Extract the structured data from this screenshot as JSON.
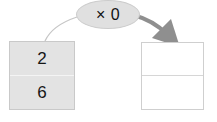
{
  "diagram": {
    "type": "multiplication-mapping",
    "operation": {
      "label": "× 0",
      "symbol": "×",
      "operand": "0",
      "shape": "ellipse",
      "fill_color": "#e0e0e0",
      "border_color": "#cccccc",
      "text_color": "#111111"
    },
    "source_table": {
      "name": "input-column",
      "fill_color": "#e3e3e3",
      "border_color": "#c9c9c9",
      "cells": [
        {
          "value": "2"
        },
        {
          "value": "6"
        }
      ]
    },
    "result_table": {
      "name": "output-column",
      "fill_color": "#ffffff",
      "border_color": "#cfcfcf",
      "cells": [
        {
          "value": ""
        },
        {
          "value": ""
        }
      ]
    },
    "connectors": [
      {
        "name": "input-connector",
        "style": "thin-curve",
        "color": "#c6c6c6",
        "from": "source-table",
        "to": "operation-bubble",
        "arrowhead": false
      },
      {
        "name": "output-arrow",
        "style": "thick-curved-arrow",
        "color": "#8f8f8f",
        "from": "operation-bubble",
        "to": "result-table",
        "arrowhead": true
      }
    ],
    "background_color": "#ffffff"
  }
}
